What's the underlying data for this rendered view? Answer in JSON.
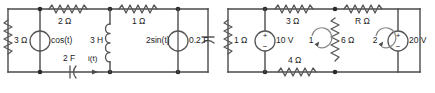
{
  "figure": {
    "background_color": "#ffffff",
    "wire_color": "#4a4a4a",
    "label_color": "#1c1c1c"
  },
  "left_circuit": {
    "name": "ac-circuit-left",
    "caption": "",
    "components": [
      {
        "id": "r3",
        "label": "3 Ω",
        "type": "resistor",
        "orientation": "vertical"
      },
      {
        "id": "src_cos",
        "label": "cos(t)",
        "type": "source",
        "orientation": "vertical"
      },
      {
        "id": "r2",
        "label": "2 Ω",
        "type": "resistor",
        "orientation": "horizontal"
      },
      {
        "id": "l3h",
        "label": "3 H",
        "type": "inductor",
        "orientation": "vertical"
      },
      {
        "id": "r1",
        "label": "1 Ω",
        "type": "resistor",
        "orientation": "horizontal"
      },
      {
        "id": "src_2sin",
        "label": "2sin(t)",
        "type": "source",
        "orientation": "vertical"
      },
      {
        "id": "c02f",
        "label": "0.2 F",
        "type": "capacitor",
        "orientation": "vertical"
      },
      {
        "id": "c2f",
        "label": "2 F",
        "type": "capacitor",
        "orientation": "horizontal"
      },
      {
        "id": "it",
        "label": "i(t)",
        "type": "current-arrow",
        "orientation": "horizontal"
      }
    ]
  },
  "right_circuit": {
    "name": "dc-mesh-circuit-right",
    "caption": "",
    "components": [
      {
        "id": "r1r",
        "label": "1 Ω",
        "type": "resistor",
        "orientation": "vertical"
      },
      {
        "id": "v10",
        "label": "10 V",
        "type": "voltage-source",
        "orientation": "vertical",
        "plus": "+",
        "minus": "−"
      },
      {
        "id": "r3r",
        "label": "3 Ω",
        "type": "resistor",
        "orientation": "horizontal"
      },
      {
        "id": "rr",
        "label": "R Ω",
        "type": "resistor",
        "orientation": "horizontal"
      },
      {
        "id": "r6",
        "label": "6 Ω",
        "type": "resistor",
        "orientation": "vertical"
      },
      {
        "id": "r4",
        "label": "4 Ω",
        "type": "resistor",
        "orientation": "horizontal"
      },
      {
        "id": "v20",
        "label": "20 V",
        "type": "voltage-source",
        "orientation": "vertical",
        "plus": "+",
        "minus": "−"
      }
    ],
    "meshes": [
      {
        "id": "mesh1",
        "label": "1",
        "direction": "clockwise"
      },
      {
        "id": "mesh2",
        "label": "2",
        "direction": "clockwise"
      }
    ]
  }
}
